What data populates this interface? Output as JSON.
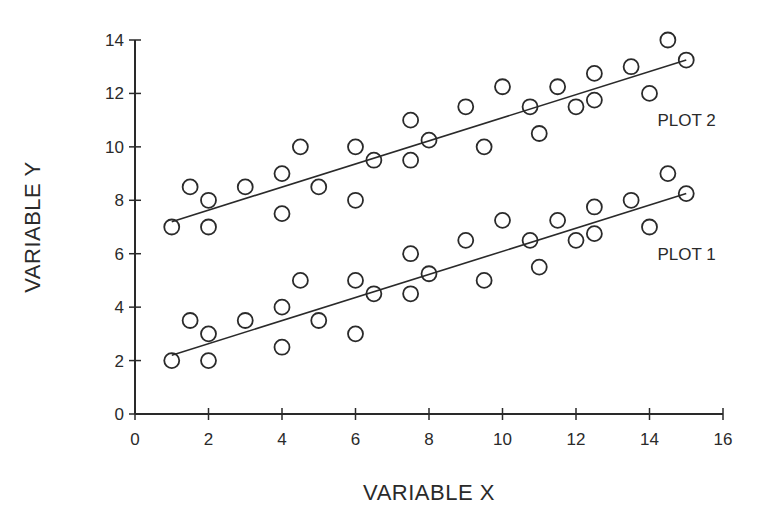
{
  "chart_data": {
    "type": "scatter",
    "title": "",
    "xlabel": "VARIABLE X",
    "ylabel": "VARIABLE Y",
    "xlim": [
      0,
      16
    ],
    "ylim": [
      0,
      14
    ],
    "xticks": [
      0,
      2,
      4,
      6,
      8,
      10,
      12,
      14,
      16
    ],
    "yticks": [
      0,
      2,
      4,
      6,
      8,
      10,
      12,
      14
    ],
    "grid": false,
    "legend": "inline labels at right end of each series",
    "marker": "open circle",
    "series": [
      {
        "name": "PLOT 1",
        "points": [
          [
            1,
            2
          ],
          [
            1.5,
            3.5
          ],
          [
            2,
            3
          ],
          [
            2,
            2
          ],
          [
            3,
            3.5
          ],
          [
            4,
            4
          ],
          [
            4,
            2.5
          ],
          [
            4.5,
            5
          ],
          [
            5,
            3.5
          ],
          [
            6,
            5
          ],
          [
            6,
            3
          ],
          [
            6.5,
            4.5
          ],
          [
            7.5,
            6
          ],
          [
            7.5,
            4.5
          ],
          [
            8,
            5.25
          ],
          [
            9,
            6.5
          ],
          [
            9.5,
            5
          ],
          [
            10,
            7.25
          ],
          [
            10.75,
            6.5
          ],
          [
            11,
            5.5
          ],
          [
            11.5,
            7.25
          ],
          [
            12,
            6.5
          ],
          [
            12.5,
            7.75
          ],
          [
            12.5,
            6.75
          ],
          [
            13.5,
            8
          ],
          [
            14,
            7
          ],
          [
            14.5,
            9
          ],
          [
            15,
            8.25
          ]
        ],
        "fit_line": {
          "x": [
            1,
            15
          ],
          "y": [
            2.2,
            8.25
          ]
        },
        "label_position": [
          14,
          6
        ]
      },
      {
        "name": "PLOT 2",
        "points": [
          [
            1,
            7
          ],
          [
            1.5,
            8.5
          ],
          [
            2,
            8
          ],
          [
            2,
            7
          ],
          [
            3,
            8.5
          ],
          [
            4,
            9
          ],
          [
            4,
            7.5
          ],
          [
            4.5,
            10
          ],
          [
            5,
            8.5
          ],
          [
            6,
            10
          ],
          [
            6,
            8
          ],
          [
            6.5,
            9.5
          ],
          [
            7.5,
            11
          ],
          [
            7.5,
            9.5
          ],
          [
            8,
            10.25
          ],
          [
            9,
            11.5
          ],
          [
            9.5,
            10
          ],
          [
            10,
            12.25
          ],
          [
            10.75,
            11.5
          ],
          [
            11,
            10.5
          ],
          [
            11.5,
            12.25
          ],
          [
            12,
            11.5
          ],
          [
            12.5,
            12.75
          ],
          [
            12.5,
            11.75
          ],
          [
            13.5,
            13
          ],
          [
            14,
            12
          ],
          [
            14.5,
            14
          ],
          [
            15,
            13.25
          ]
        ],
        "fit_line": {
          "x": [
            1,
            15
          ],
          "y": [
            7.2,
            13.25
          ]
        },
        "label_position": [
          14,
          11
        ]
      }
    ]
  },
  "colors": {
    "ink": "#2a2a2a",
    "background": "#ffffff"
  }
}
